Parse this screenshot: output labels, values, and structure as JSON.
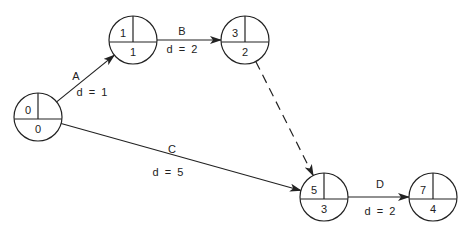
{
  "diagram": {
    "type": "activity-on-arrow network",
    "nodes": [
      {
        "id": "0",
        "number": "0",
        "earliest": "0"
      },
      {
        "id": "1",
        "number": "1",
        "earliest": "1"
      },
      {
        "id": "3",
        "number": "3",
        "earliest": "2"
      },
      {
        "id": "5",
        "number": "5",
        "earliest": "3"
      },
      {
        "id": "7",
        "number": "7",
        "earliest": "4"
      }
    ],
    "edges": [
      {
        "from": "0",
        "to": "1",
        "activity": "A",
        "duration": "d = 1",
        "dashed": false
      },
      {
        "from": "1",
        "to": "3",
        "activity": "B",
        "duration": "d = 2",
        "dashed": false
      },
      {
        "from": "0",
        "to": "5",
        "activity": "C",
        "duration": "d = 5",
        "dashed": false
      },
      {
        "from": "3",
        "to": "5",
        "activity": "",
        "duration": "",
        "dashed": true
      },
      {
        "from": "5",
        "to": "7",
        "activity": "D",
        "duration": "d = 2",
        "dashed": false
      }
    ]
  }
}
